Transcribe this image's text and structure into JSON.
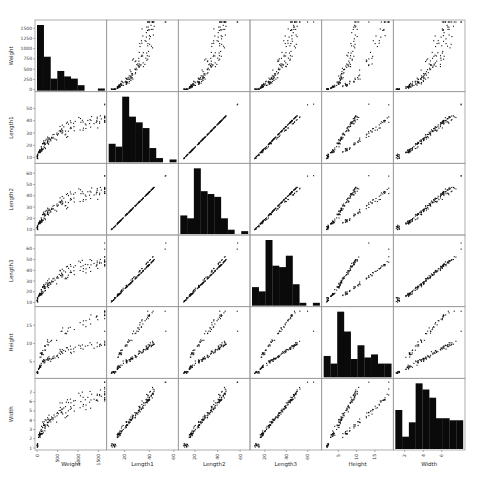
{
  "chart_data": {
    "type": "scatter",
    "title": "",
    "subtitle": "Scatter matrix (pair plot) with histograms on diagonal",
    "variables": [
      "Weight",
      "Length1",
      "Length2",
      "Length3",
      "Height",
      "Width"
    ],
    "grid": false,
    "legend": null,
    "axes": {
      "Weight": {
        "range": [
          0,
          1650
        ],
        "ticks": [
          0,
          250,
          500,
          750,
          1000,
          1250,
          1500
        ],
        "x_ticks": [
          0,
          500,
          1000,
          1500
        ]
      },
      "Length1": {
        "range": [
          7,
          62
        ],
        "ticks": [
          10,
          20,
          30,
          40,
          50
        ],
        "x_ticks": [
          20,
          40,
          60
        ]
      },
      "Length2": {
        "range": [
          7,
          67
        ],
        "ticks": [
          10,
          20,
          30,
          40,
          50,
          60
        ],
        "x_ticks": [
          20,
          40,
          60
        ]
      },
      "Length3": {
        "range": [
          8,
          71
        ],
        "ticks": [
          10,
          20,
          30,
          40,
          50,
          60
        ],
        "x_ticks": [
          20,
          40,
          60
        ]
      },
      "Height": {
        "range": [
          1,
          19.5
        ],
        "ticks": [
          5,
          10,
          15
        ],
        "x_ticks": [
          5,
          10,
          15
        ]
      },
      "Width": {
        "range": [
          1,
          8.3
        ],
        "ticks": [
          1,
          2,
          3,
          4,
          5,
          6,
          7
        ],
        "x_ticks": [
          2,
          4,
          6
        ]
      }
    },
    "histograms": {
      "Weight": [
        60,
        31,
        11,
        18,
        13,
        11,
        5,
        0,
        0,
        2
      ],
      "Length1": [
        13,
        11,
        46,
        32,
        28,
        24,
        10,
        3,
        0,
        2
      ],
      "Length2": [
        13,
        11,
        46,
        30,
        28,
        26,
        11,
        3,
        0,
        2
      ],
      "Length3": [
        13,
        10,
        46,
        28,
        27,
        35,
        15,
        2,
        0,
        2
      ],
      "Height": [
        14,
        9,
        43,
        30,
        12,
        21,
        13,
        15,
        9,
        9
      ],
      "Width": [
        19,
        6,
        13,
        32,
        29,
        25,
        15,
        15,
        14,
        14
      ]
    },
    "relationship_notes": "Length1, Length2, Length3 nearly perfectly linear with each other; Weight vs lengths and widths is convex/exponential; Height shows two diverging linear branches against lengths.",
    "n_points": 159
  },
  "figure": {
    "labels": {
      "Weight": "Weight",
      "Length1": "Length1",
      "Length2": "Length2",
      "Length3": "Length3",
      "Height": "Height",
      "Width": "Width"
    }
  }
}
